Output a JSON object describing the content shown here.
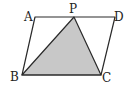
{
  "diagram": {
    "type": "parallelogram-with-shaded-triangle",
    "colors": {
      "stroke": "#2a2a2a",
      "shade": "#c8c8c8",
      "background": "#ffffff"
    },
    "points": {
      "A": {
        "label": "A",
        "x": 35,
        "y": 17
      },
      "P": {
        "label": "P",
        "x": 74,
        "y": 17
      },
      "D": {
        "label": "D",
        "x": 115,
        "y": 17
      },
      "B": {
        "label": "B",
        "x": 22,
        "y": 75
      },
      "C": {
        "label": "C",
        "x": 101,
        "y": 75
      }
    },
    "shaded_triangle": [
      "P",
      "B",
      "C"
    ],
    "parallelogram": [
      "A",
      "D",
      "C",
      "B"
    ]
  }
}
